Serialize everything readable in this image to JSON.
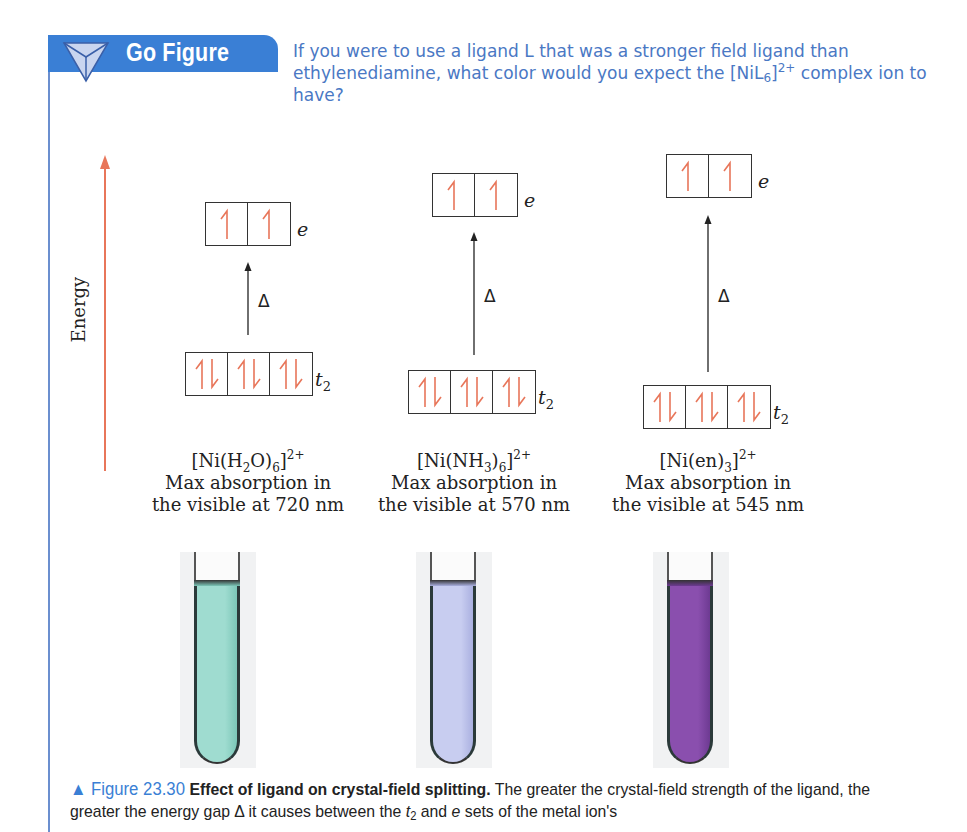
{
  "go_figure": {
    "title": "Go Figure",
    "question_part1": "If you were to use a ligand L that was a stronger field ligand than ethylenediamine, what color would you expect the ",
    "question_formula": "[NiL",
    "question_formula_sub": "6",
    "question_formula_close": "]",
    "question_formula_sup": "2+",
    "question_part2": " complex ion to have?",
    "accent_color": "#3a7fd5",
    "text_color": "#4a78c4"
  },
  "energy_axis": {
    "label": "Energy",
    "arrow_color": "#e8765a"
  },
  "orbital_labels": {
    "upper": "e",
    "lower_base": "t",
    "lower_sub": "2",
    "gap": "Δ"
  },
  "complexes": [
    {
      "formula_parts": [
        "[Ni(H",
        "2",
        "O)",
        "6",
        "]",
        "2+"
      ],
      "line1": "Max absorption in",
      "line2": "the visible at 720 nm",
      "max_absorption_nm": 720,
      "e_electrons": [
        "up",
        "up"
      ],
      "t2_electrons": [
        "pair",
        "pair",
        "pair"
      ],
      "solution_color": "#9fdcd0",
      "solution_edge": "#7cc7b8"
    },
    {
      "formula_parts": [
        "[Ni(NH",
        "3",
        ")",
        "6",
        "]",
        "2+"
      ],
      "line1": "Max absorption in",
      "line2": "the visible at 570 nm",
      "max_absorption_nm": 570,
      "e_electrons": [
        "up",
        "up"
      ],
      "t2_electrons": [
        "pair",
        "pair",
        "pair"
      ],
      "solution_color": "#c8cdf0",
      "solution_edge": "#aab0e0"
    },
    {
      "formula_parts": [
        "[Ni(en)",
        "3",
        "]",
        "2+"
      ],
      "line1": "Max absorption in",
      "line2": "the visible at 545 nm",
      "max_absorption_nm": 545,
      "e_electrons": [
        "up",
        "up"
      ],
      "t2_electrons": [
        "pair",
        "pair",
        "pair"
      ],
      "solution_color": "#8a4fae",
      "solution_edge": "#6d3a92"
    }
  ],
  "caption": {
    "marker": "▲",
    "figure_number": "Figure 23.30",
    "bold_title": "Effect of ligand on crystal-field splitting.",
    "text_part1": " The greater the crystal-field strength of the ligand, the greater the energy gap Δ it causes between the ",
    "t2_base": "t",
    "t2_sub": "2",
    "text_part2": " and ",
    "e_label": "e",
    "text_part3": " sets of the metal ion's"
  }
}
